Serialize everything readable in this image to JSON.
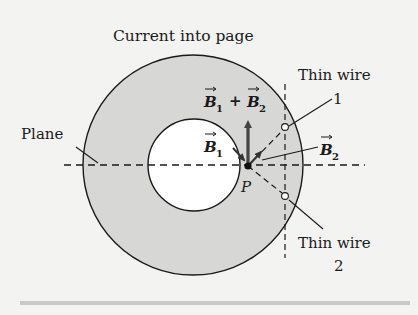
{
  "figure": {
    "title": "Current into page",
    "labels": {
      "plane": "Plane",
      "thin_wire_1_text": "Thin wire",
      "thin_wire_1_num": "1",
      "thin_wire_2_text": "Thin wire",
      "thin_wire_2_num": "2",
      "point": "P",
      "b1_symbol": "B",
      "b1_sub": "1",
      "b2_symbol": "B",
      "b2_sub": "2",
      "sum_b1_symbol": "B",
      "sum_b1_sub": "1",
      "sum_plus": "+",
      "sum_b2_symbol": "B",
      "sum_b2_sub": "2"
    },
    "colors": {
      "background": "#f3f3f2",
      "annulus_fill": "#d7d7d5",
      "hole_fill": "#ffffff",
      "stroke": "#1a1a1a",
      "resultant_arrow": "#444444",
      "footer_bar": "#c9c9c9"
    },
    "geometry": {
      "outer_circle": {
        "cx": 193,
        "cy": 165,
        "r": 110
      },
      "inner_circle": {
        "cx": 194,
        "cy": 165,
        "r": 46
      },
      "point_p": {
        "x": 248,
        "y": 166
      },
      "wire_1": {
        "x": 285,
        "y": 127
      },
      "wire_2": {
        "x": 285,
        "y": 196
      }
    }
  }
}
